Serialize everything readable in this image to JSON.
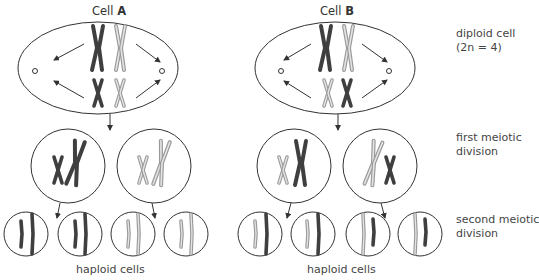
{
  "cells": {
    "a": {
      "prefix": "Cell",
      "letter": "A"
    },
    "b": {
      "prefix": "Cell",
      "letter": "B"
    }
  },
  "stage_labels": {
    "diploid": {
      "line1": "diploid cell",
      "line2": "(2n = 4)"
    },
    "first": {
      "line1": "first meiotic",
      "line2": "division"
    },
    "second": {
      "line1": "second meiotic",
      "line2": "division"
    }
  },
  "haploid_label_a": "haploid cells",
  "haploid_label_b": "haploid cells",
  "colors": {
    "dark_chromosome": "#3f3f3f",
    "light_chromosome": "#a8a8a8",
    "outline": "#333333"
  }
}
